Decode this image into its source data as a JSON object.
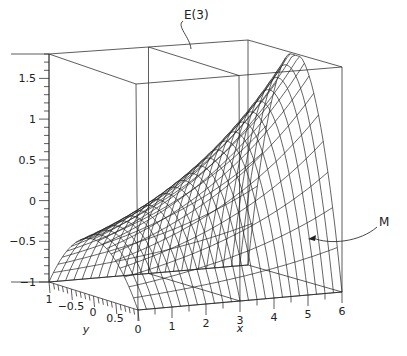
{
  "chart_data": {
    "type": "surface",
    "title": "",
    "surface": {
      "description": "Wireframe surface over x in [0,6], y in [-1,1]; parabolic cross-section in y, peak grows with x",
      "x_range": [
        0,
        6
      ],
      "y_range": [
        -1,
        1
      ],
      "grid_lines_x": 25,
      "grid_lines_y": 21,
      "samples": {
        "x_at_y0": [
          0,
          1,
          2,
          3,
          4,
          5,
          6
        ],
        "z_at_y0": [
          -0.3,
          -0.1,
          0.1,
          0.4,
          0.8,
          1.3,
          1.75
        ],
        "z_at_y_pm1": -1
      }
    },
    "axes": {
      "x": {
        "label": "x",
        "range": [
          0,
          6
        ],
        "ticks": [
          0,
          1,
          2,
          3,
          4,
          5,
          6
        ],
        "tick_labels": [
          "0",
          "1",
          "2",
          "3",
          "4",
          "5",
          "6"
        ]
      },
      "y": {
        "label": "y",
        "range": [
          -1,
          1
        ],
        "ticks": [
          1,
          -0.5,
          0,
          0.5
        ],
        "tick_labels": [
          "1",
          "−0.5",
          "0",
          "0.5"
        ]
      },
      "z": {
        "label": "",
        "range": [
          -1,
          1.8
        ],
        "ticks": [
          -1,
          -0.5,
          0,
          0.5,
          1,
          1.5
        ],
        "tick_labels": [
          "−1",
          "−0.5",
          "0",
          "0.5",
          "1",
          "1.5"
        ]
      }
    },
    "box": {
      "plane_at_x": 3
    },
    "annotations": [
      {
        "text": "E(3)",
        "target": "plane x=3"
      },
      {
        "text": "M",
        "target": "surface"
      }
    ],
    "grid": false,
    "legend": "none"
  }
}
